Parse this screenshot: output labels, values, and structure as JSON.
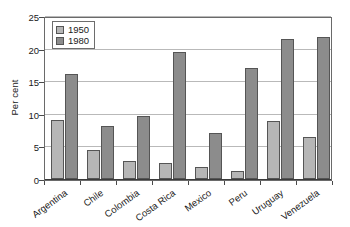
{
  "chart_data": {
    "type": "bar",
    "title": "",
    "xlabel": "",
    "ylabel": "Per cent",
    "ylim": [
      0,
      25
    ],
    "yticks": [
      0,
      5,
      10,
      15,
      20,
      25
    ],
    "grid": true,
    "legend_position": "top-left",
    "categories": [
      "Argentina",
      "Chile",
      "Colombia",
      "Costa Rica",
      "Mexico",
      "Peru",
      "Uruguay",
      "Venezuela"
    ],
    "series": [
      {
        "name": "1950",
        "color": "#b6b6b6",
        "values": [
          9.0,
          4.4,
          2.7,
          2.4,
          1.8,
          1.3,
          8.9,
          6.5
        ]
      },
      {
        "name": "1980",
        "color": "#8c8c8c",
        "values": [
          16.1,
          8.1,
          9.7,
          19.5,
          7.0,
          17.0,
          21.4,
          21.8
        ]
      }
    ]
  },
  "axis": {
    "y_title": "Per cent",
    "y_tick_labels": [
      "0",
      "5",
      "10",
      "15",
      "20",
      "25"
    ]
  },
  "legend": {
    "items": [
      {
        "label": "1950",
        "color": "#b6b6b6"
      },
      {
        "label": "1980",
        "color": "#8c8c8c"
      }
    ]
  }
}
